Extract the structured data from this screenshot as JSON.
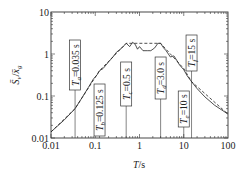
{
  "chart_data": {
    "type": "line",
    "title": "",
    "xlabel": "T/s",
    "ylabel": "S̄v/x̄g",
    "x_scale": "log",
    "y_scale": "log",
    "xlim": [
      0.01,
      100
    ],
    "ylim": [
      0.01,
      10
    ],
    "x_ticks": [
      0.01,
      0.1,
      1,
      10,
      100
    ],
    "x_tick_labels": [
      "0.01",
      "0.1",
      "1",
      "10",
      "100"
    ],
    "y_ticks": [
      0.01,
      0.1,
      1,
      10
    ],
    "y_tick_labels": [
      "0.01",
      "0.1",
      "1",
      "10"
    ],
    "grid": false,
    "legend": null,
    "series": [
      {
        "name": "Spectrum (solid)",
        "style": "solid",
        "x": [
          0.01,
          0.02,
          0.035,
          0.05,
          0.07,
          0.09,
          0.11,
          0.125,
          0.15,
          0.2,
          0.25,
          0.3,
          0.4,
          0.5,
          0.6,
          0.7,
          0.8,
          0.9,
          1.0,
          1.2,
          1.5,
          1.8,
          2.2,
          2.6,
          3.0,
          3.5,
          4.0,
          5.0,
          6.0,
          7.0,
          8.0,
          10.0,
          12.0,
          15.0,
          20.0,
          30.0,
          50.0,
          100.0
        ],
        "y": [
          0.014,
          0.027,
          0.05,
          0.09,
          0.16,
          0.25,
          0.32,
          0.4,
          0.45,
          0.65,
          0.85,
          1.1,
          1.4,
          1.8,
          1.5,
          1.9,
          1.7,
          1.3,
          1.5,
          1.2,
          1.2,
          1.2,
          1.4,
          1.8,
          1.8,
          1.4,
          1.2,
          0.85,
          0.9,
          0.7,
          0.55,
          0.42,
          0.3,
          0.22,
          0.15,
          0.095,
          0.06,
          0.037
        ]
      },
      {
        "name": "Design spectrum (dashed)",
        "style": "dashed",
        "x": [
          0.01,
          0.035,
          0.125,
          0.5,
          3.0,
          10.0,
          15.0,
          100.0
        ],
        "y": [
          0.014,
          0.05,
          0.4,
          1.8,
          1.8,
          0.45,
          0.22,
          0.037
        ]
      }
    ],
    "vertical_markers": [
      {
        "label": "Ta=0.035 s",
        "x": 0.035,
        "sub": "a",
        "value": "=0.035 s"
      },
      {
        "label": "Tb=0.125 s",
        "x": 0.125,
        "sub": "b",
        "value": "=0.125 s"
      },
      {
        "label": "Tc=0.5 s",
        "x": 0.5,
        "sub": "c",
        "value": "=0.5 s"
      },
      {
        "label": "Td=3.0 s",
        "x": 3.0,
        "sub": "d",
        "value": "=3.0 s"
      },
      {
        "label": "Te=10 s",
        "x": 10.0,
        "sub": "e",
        "value": "=10 s"
      },
      {
        "label": "Tf=15 s",
        "x": 15.0,
        "sub": "f",
        "value": "=15 s"
      }
    ]
  },
  "labels": {
    "x_axis_title": "T/s",
    "y_axis_title": "S̄v/x̄g"
  }
}
